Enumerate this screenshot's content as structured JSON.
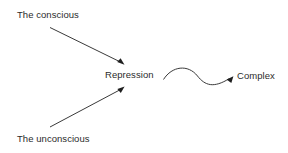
{
  "diagram": {
    "background_color": "#ffffff",
    "line_color": "#3a3a3a",
    "text_color": "#2b2b2b",
    "nodes": [
      {
        "id": "conscious",
        "label": "The conscious"
      },
      {
        "id": "unconscious",
        "label": "The unconscious"
      },
      {
        "id": "repression",
        "label": "Repression"
      },
      {
        "id": "complex",
        "label": "Complex"
      }
    ],
    "edges": [
      {
        "id": "conscious-to-repression",
        "from": "conscious",
        "to": "repression",
        "style": "straight-arrow"
      },
      {
        "id": "unconscious-to-repression",
        "from": "unconscious",
        "to": "repression",
        "style": "straight-arrow"
      },
      {
        "id": "repression-to-complex",
        "from": "repression",
        "to": "complex",
        "style": "curved-arrow"
      }
    ]
  }
}
